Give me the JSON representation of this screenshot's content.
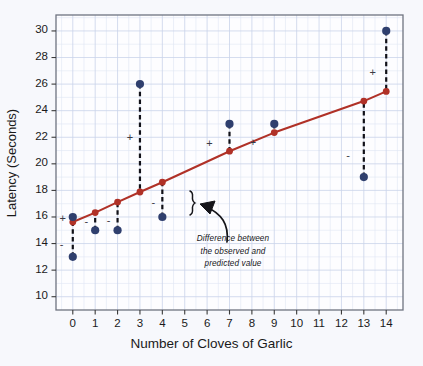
{
  "chart_data": {
    "type": "scatter",
    "title": "",
    "xlabel": "Number of Cloves of Garlic",
    "ylabel": "Latency (Seconds)",
    "xlim": [
      -0.75,
      14.75
    ],
    "ylim": [
      9.0,
      31.2
    ],
    "xticks": [
      0,
      1,
      2,
      3,
      4,
      5,
      6,
      7,
      8,
      9,
      10,
      11,
      12,
      13,
      14
    ],
    "xtick_labels": [
      "0",
      "1",
      "2",
      "3",
      "4",
      "5",
      "6",
      "7",
      "8",
      "9",
      "10",
      "11",
      "12",
      "13",
      "14"
    ],
    "yticks": [
      10,
      12,
      14,
      16,
      18,
      20,
      22,
      24,
      26,
      28,
      30
    ],
    "ytick_labels": [
      "10",
      "12",
      "14",
      "16",
      "18",
      "20",
      "22",
      "24",
      "26",
      "28",
      "30"
    ],
    "grid": true,
    "grid_minor": true,
    "legend": "none",
    "observed_color": "#2f3f6e",
    "predicted_color": "#b03127",
    "series": [
      {
        "name": "Observed",
        "type": "scatter",
        "color": "#2f3f6e",
        "x": [
          0,
          0,
          1,
          2,
          3,
          4,
          7,
          9,
          13,
          14
        ],
        "values": [
          16.0,
          13.0,
          15.0,
          15.0,
          26.0,
          16.0,
          23.0,
          23.0,
          19.0,
          30.0
        ]
      },
      {
        "name": "Predicted (regression line)",
        "type": "line",
        "color": "#b03127",
        "x": [
          0,
          1,
          2,
          3,
          4,
          7,
          9,
          13,
          14
        ],
        "values": [
          15.62,
          16.33,
          17.12,
          17.88,
          18.62,
          20.95,
          22.35,
          24.72,
          25.45
        ]
      }
    ],
    "residual_markers": [
      {
        "sign": "+",
        "x": -0.45,
        "y": 15.9
      },
      {
        "sign": "-",
        "x": -0.5,
        "y": 13.9
      },
      {
        "sign": "-",
        "x": 0.6,
        "y": 15.65
      },
      {
        "sign": "-",
        "x": 1.6,
        "y": 15.7
      },
      {
        "sign": "+",
        "x": 2.55,
        "y": 22.0
      },
      {
        "sign": "-",
        "x": 3.6,
        "y": 17.1
      },
      {
        "sign": "+",
        "x": 6.1,
        "y": 21.5
      },
      {
        "sign": "+",
        "x": 8.05,
        "y": 21.6
      },
      {
        "sign": "-",
        "x": 12.3,
        "y": 20.6
      },
      {
        "sign": "+",
        "x": 13.4,
        "y": 26.9
      }
    ],
    "annotation": {
      "lines": [
        "Difference between",
        "the observed and",
        "predicted value"
      ],
      "brace_target_x": 4,
      "brace_target_y_range": [
        16.0,
        18.62
      ]
    }
  }
}
